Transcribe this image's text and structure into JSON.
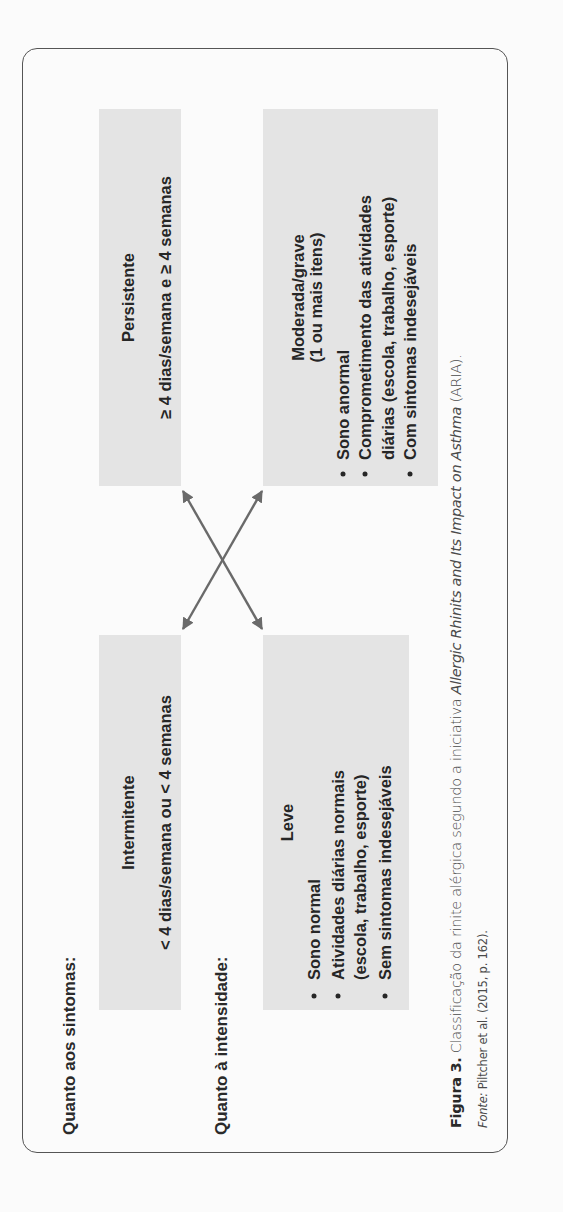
{
  "figure": {
    "labels": {
      "symptoms": "Quanto aos sintomas:",
      "intensity": "Quanto à intensidade:"
    },
    "boxes": {
      "persistent": {
        "title": "Persistente",
        "subtitle": "≥ 4 dias/semana e ≥ 4 semanas"
      },
      "intermittent": {
        "title": "Intermitente",
        "subtitle": "< 4 dias/semana ou < 4 semanas"
      },
      "moderate": {
        "title": "Moderada/grave",
        "subtitle": "(1 ou mais itens)",
        "bullets": [
          "Sono anormal",
          "Comprometimento das atividades",
          "diárias (escola, trabalho, esporte)",
          "Com sintomas indesejáveis"
        ]
      },
      "mild": {
        "title": "Leve",
        "bullets": [
          "Sono normal",
          "Atividades diárias normais",
          "(escola, trabalho, esporte)",
          "Sem sintomas indesejáveis"
        ]
      }
    },
    "arrows": [
      {
        "from": "intermitente",
        "to": "moderada/grave",
        "type": "double-headed"
      },
      {
        "from": "leve",
        "to": "persistente",
        "type": "double-headed"
      }
    ],
    "colors": {
      "box_fill": "#e4e4e4",
      "arrow": "#6a6a6a",
      "frame": "#555555"
    }
  },
  "caption": {
    "label": "Figura 3.",
    "text_before": " Classificação da rinite alérgica segundo a iniciativa ",
    "italic": "Allergic Rhinits and Its Impact on Asthma",
    "text_after": " (ARIA).",
    "source_label": "Fonte:",
    "source_text": " Piltcher et al. (2015, p. 162)."
  }
}
